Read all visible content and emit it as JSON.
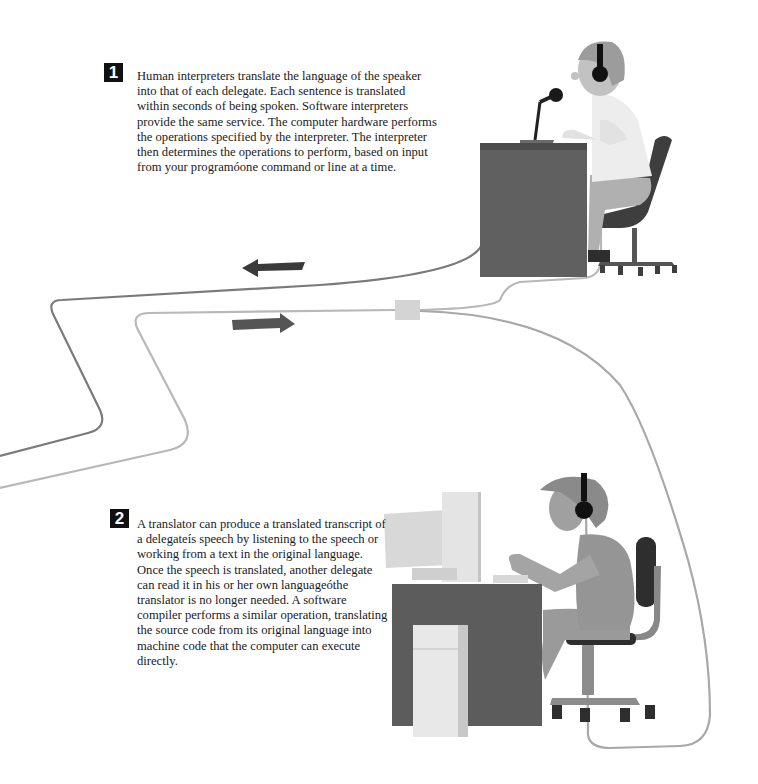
{
  "figure": {
    "section1": {
      "badge": "1",
      "text": "Human interpreters translate the language of the speaker into that of each delegate. Each sentence is translated within seconds of being spoken. Software interpreters provide the same service. The computer hardware performs the operations specified by the interpreter. The interpreter then determines the operations to perform, based on input from your programóone command or line at a time."
    },
    "section2": {
      "badge": "2",
      "text": "A translator can produce a translated transcript of a delegateís speech by listening to the speech or working from a text in the original language. Once the speech is translated, another delegate can read it in his or her own languageóthe translator is no longer needed. A software compiler performs a similar operation, translating the source code from its original language into machine code that the computer can execute directly."
    },
    "illustrations": [
      {
        "name": "interpreter-at-desk",
        "elements": [
          "headphones",
          "microphone",
          "desk",
          "office-chair"
        ]
      },
      {
        "name": "translator-at-computer",
        "elements": [
          "headphones",
          "monitor",
          "computer-tower",
          "desk",
          "office-chair"
        ]
      }
    ],
    "arrows": [
      {
        "name": "arrow-left",
        "direction": "left"
      },
      {
        "name": "arrow-right",
        "direction": "right"
      }
    ],
    "colors": {
      "dark": "#3a3a3a",
      "desk": "#5e5e5e",
      "mid": "#8a8a8a",
      "skin": "#a8a8a8",
      "light": "#d6d6d6",
      "shirt": "#ececec",
      "cable_dark": "#7a7a7a",
      "cable_light": "#b8b8b8"
    }
  }
}
